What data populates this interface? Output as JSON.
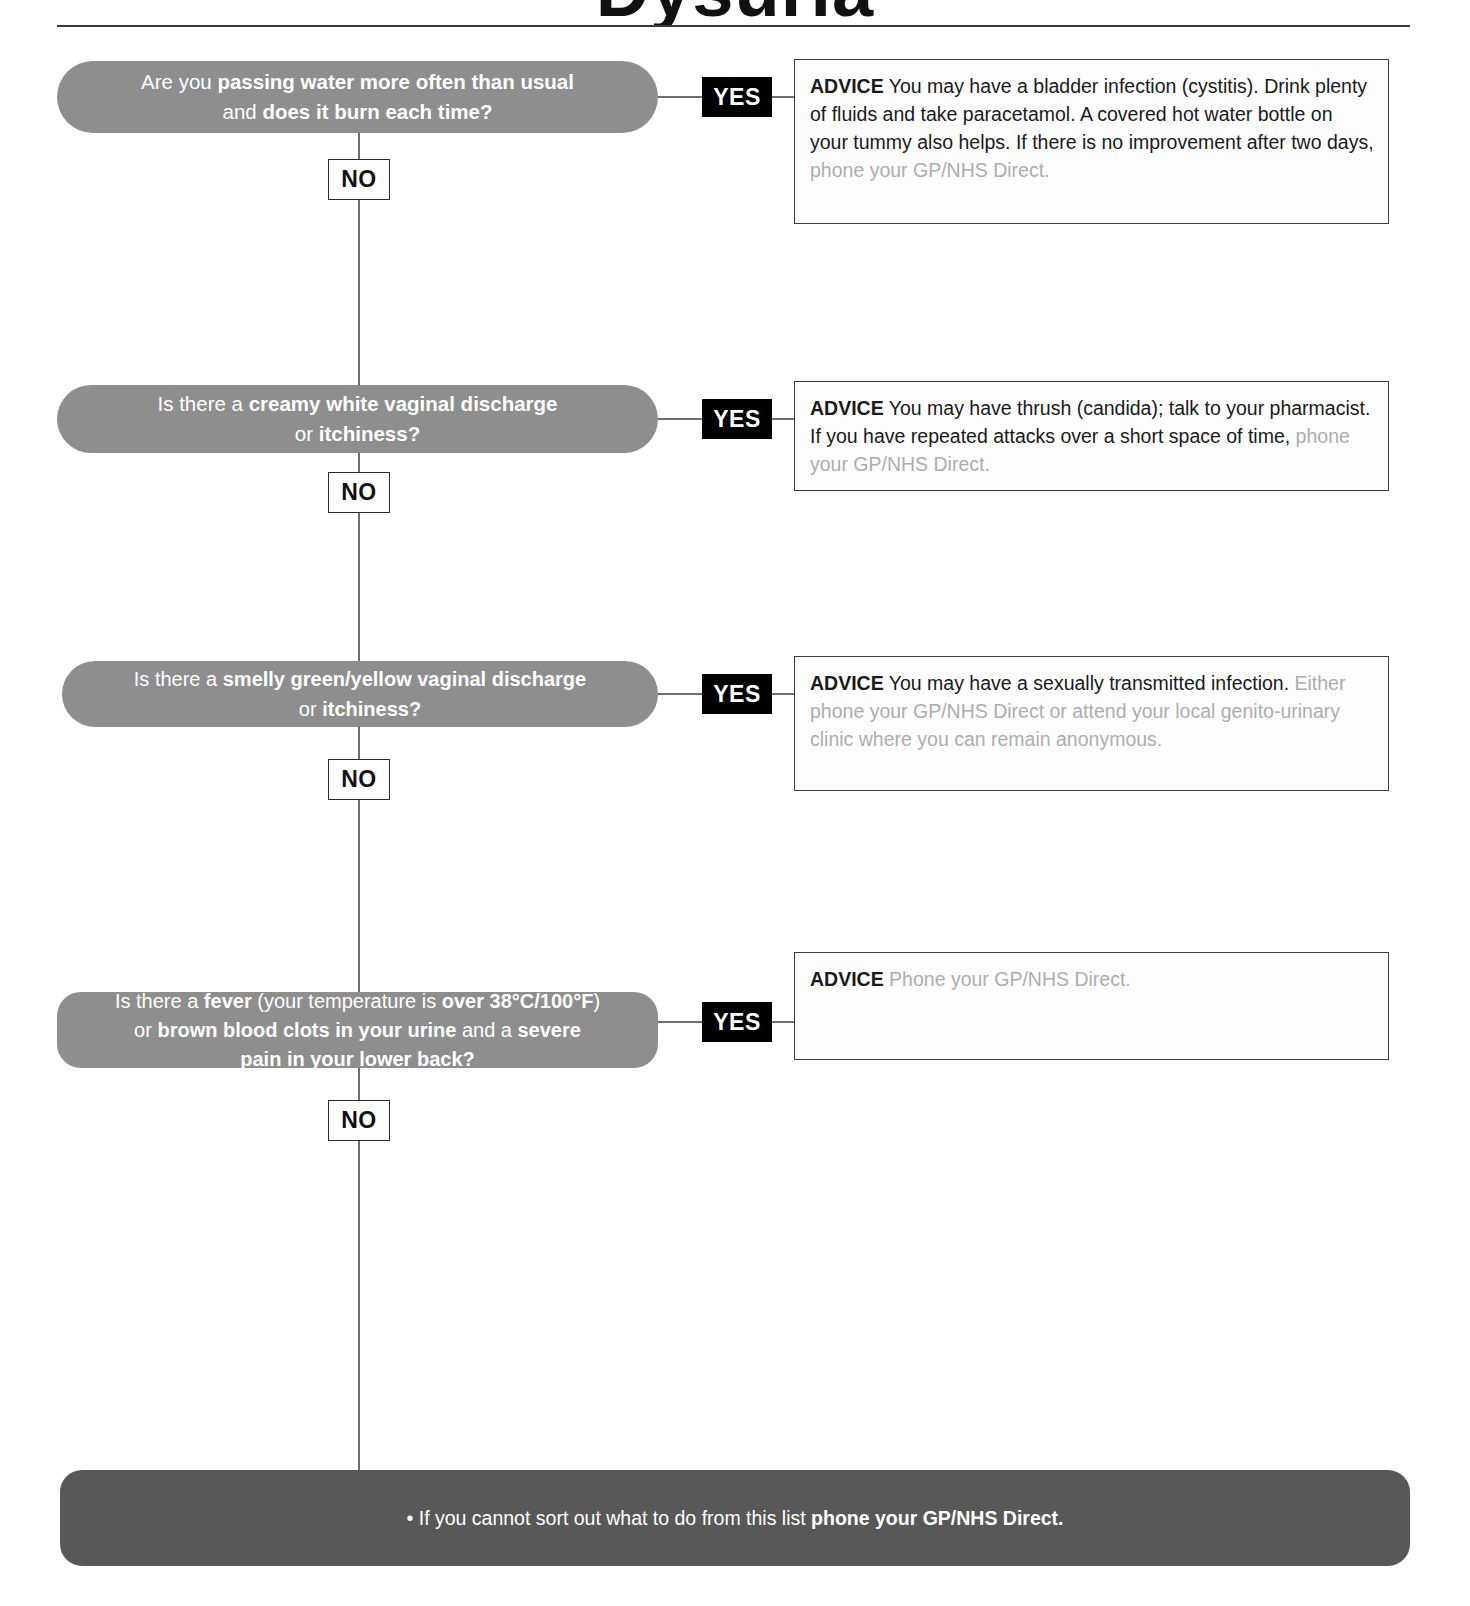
{
  "header": {
    "title_partial_glyphs": "Dysuria",
    "rule": "horizontal-rule"
  },
  "branch_labels": {
    "yes": "YES",
    "no": "NO"
  },
  "colors": {
    "bubble_fill": "#8e8e8e",
    "bubble_text": "#ffffff",
    "yes_badge_fill": "#000000",
    "yes_badge_text": "#ffffff",
    "no_badge_fill": "#ffffff",
    "no_badge_text": "#111111",
    "connector_line": "#6e6e6e",
    "advice_border": "#3d3d3d",
    "advice_text": "#1a1a1a",
    "advice_muted_text": "#adadad",
    "banner_fill": "#585858",
    "banner_text": "#ffffff"
  },
  "steps": [
    {
      "id": "step-1",
      "question_plain": "Are you passing water more often than usual and does it burn each time?",
      "question_line1_pre": "Are you ",
      "question_line1_bold": "passing water more often than usual",
      "question_line2_pre": "and ",
      "question_line2_bold": "does it burn each time?",
      "advice_label": "ADVICE",
      "advice_body": " You may have a bladder infection (cystitis). Drink plenty of fluids and take paracetamol. A covered hot water bottle on your tummy also helps. If there is no improvement after two days, ",
      "advice_muted": "phone your GP/NHS Direct."
    },
    {
      "id": "step-2",
      "question_plain": "Is there a creamy white vaginal discharge or itchiness?",
      "question_line1_pre": "Is there a ",
      "question_line1_bold": "creamy white vaginal discharge",
      "question_line2_pre": "or ",
      "question_line2_bold": "itchiness?",
      "advice_label": "ADVICE",
      "advice_body": " You may have thrush (candida); talk to your pharmacist. If you have repeated attacks over a short space of time, ",
      "advice_muted": "phone your GP/NHS Direct."
    },
    {
      "id": "step-3",
      "question_plain": "Is there a smelly green/yellow vaginal discharge or itchiness?",
      "question_line1_pre": "Is there a ",
      "question_line1_bold": "smelly green/yellow vaginal discharge",
      "question_line2_pre": "or ",
      "question_line2_bold": "itchiness?",
      "advice_label": "ADVICE",
      "advice_body": " You may have a sexually transmitted infection. ",
      "advice_muted": "Either phone your GP/NHS Direct or attend your local genito-urinary clinic where you can remain anonymous."
    },
    {
      "id": "step-4",
      "question_plain": "Is there a fever (your temperature is over 38°C/100°F) or brown blood clots in your urine and a severe pain in your lower back?",
      "question_line1_pre": "Is there a ",
      "question_line1_bold": "fever",
      "question_line1_mid": " (your temperature is ",
      "question_line1_bold2": "over 38°C/100°F",
      "question_line1_post": ")",
      "question_line2_pre": "or ",
      "question_line2_bold": "brown blood clots in your urine",
      "question_line2_mid": " and a ",
      "question_line2_bold2": "severe",
      "question_line3_bold": "pain in your lower back?",
      "advice_label": "ADVICE",
      "advice_body": " ",
      "advice_muted": "Phone your GP/NHS Direct."
    }
  ],
  "bottom_banner": {
    "bullet": "•",
    "text": " If you cannot sort out what to do from this list ",
    "bold_text": "phone your GP/NHS Direct."
  }
}
